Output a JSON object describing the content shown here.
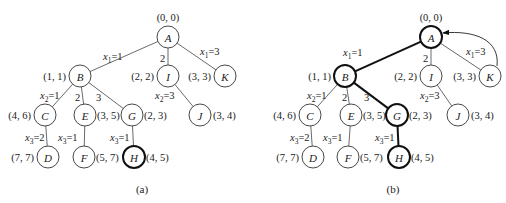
{
  "figures": [
    {
      "caption": "(a)",
      "nodes": [
        {
          "id": "A",
          "label": "A",
          "coord": "(0, 0)",
          "x": 168,
          "y": 37,
          "cx": 168,
          "cy": 17,
          "anchor": "middle",
          "bold": false
        },
        {
          "id": "B",
          "label": "B",
          "coord": "(1, 1)",
          "x": 80,
          "y": 76,
          "cx": 66,
          "cy": 76,
          "anchor": "end",
          "bold": false
        },
        {
          "id": "I",
          "label": "I",
          "coord": "(2, 2)",
          "x": 168,
          "y": 76,
          "cx": 154,
          "cy": 76,
          "anchor": "end",
          "bold": false
        },
        {
          "id": "K",
          "label": "K",
          "coord": "(3, 3)",
          "x": 225,
          "y": 76,
          "cx": 211,
          "cy": 76,
          "anchor": "end",
          "bold": false
        },
        {
          "id": "C",
          "label": "C",
          "coord": "(4, 6)",
          "x": 45,
          "y": 115,
          "cx": 31,
          "cy": 115,
          "anchor": "end",
          "bold": false
        },
        {
          "id": "E",
          "label": "E",
          "coord": "(3, 5)",
          "x": 85,
          "y": 115,
          "cx": 97,
          "cy": 115,
          "anchor": "start",
          "bold": false
        },
        {
          "id": "G",
          "label": "G",
          "coord": "(2, 3)",
          "x": 132,
          "y": 115,
          "cx": 144,
          "cy": 115,
          "anchor": "start",
          "bold": false
        },
        {
          "id": "J",
          "label": "J",
          "coord": "(3, 4)",
          "x": 200,
          "y": 115,
          "cx": 213,
          "cy": 115,
          "anchor": "start",
          "bold": false
        },
        {
          "id": "D",
          "label": "D",
          "coord": "(7, 7)",
          "x": 48,
          "y": 157,
          "cx": 34,
          "cy": 157,
          "anchor": "end",
          "bold": false
        },
        {
          "id": "F",
          "label": "F",
          "coord": "(5, 7)",
          "x": 84,
          "y": 157,
          "cx": 96,
          "cy": 157,
          "anchor": "start",
          "bold": false
        },
        {
          "id": "H",
          "label": "H",
          "coord": "(4, 5)",
          "x": 134,
          "y": 157,
          "cx": 146,
          "cy": 157,
          "anchor": "start",
          "bold": true
        }
      ],
      "edges": [
        {
          "from": "A",
          "to": "B",
          "label_var": "x",
          "label_sub": "1",
          "label_val": "=1",
          "lx": 103,
          "ly": 60,
          "bold": false
        },
        {
          "from": "A",
          "to": "I",
          "label_var": "",
          "label_sub": "",
          "label_val": "2",
          "lx": 160,
          "ly": 62,
          "bold": false
        },
        {
          "from": "A",
          "to": "K",
          "label_var": "x",
          "label_sub": "1",
          "label_val": "=3",
          "lx": 200,
          "ly": 55,
          "bold": false
        },
        {
          "from": "B",
          "to": "C",
          "label_var": "x",
          "label_sub": "2",
          "label_val": "=1",
          "lx": 40,
          "ly": 99,
          "bold": false
        },
        {
          "from": "B",
          "to": "E",
          "label_var": "",
          "label_sub": "",
          "label_val": "2",
          "lx": 75,
          "ly": 101,
          "bold": false
        },
        {
          "from": "B",
          "to": "G",
          "label_var": "",
          "label_sub": "",
          "label_val": "3",
          "lx": 96,
          "ly": 101,
          "bold": false
        },
        {
          "from": "I",
          "to": "J",
          "label_var": "x",
          "label_sub": "2",
          "label_val": "=3",
          "lx": 155,
          "ly": 99,
          "bold": false
        },
        {
          "from": "C",
          "to": "D",
          "label_var": "x",
          "label_sub": "3",
          "label_val": "=2",
          "lx": 25,
          "ly": 141,
          "bold": false
        },
        {
          "from": "E",
          "to": "F",
          "label_var": "x",
          "label_sub": "3",
          "label_val": "=1",
          "lx": 58,
          "ly": 141,
          "bold": false
        },
        {
          "from": "G",
          "to": "H",
          "label_var": "x",
          "label_sub": "3",
          "label_val": "=1",
          "lx": 110,
          "ly": 141,
          "bold": false
        }
      ],
      "back_arrow": null,
      "caption_x": 142,
      "caption_y": 193
    },
    {
      "caption": "(b)",
      "nodes": [
        {
          "id": "A",
          "label": "A",
          "coord": "(0, 0)",
          "x": 431,
          "y": 37,
          "cx": 431,
          "cy": 17,
          "anchor": "middle",
          "bold": true
        },
        {
          "id": "B",
          "label": "B",
          "coord": "(1, 1)",
          "x": 345,
          "y": 76,
          "cx": 331,
          "cy": 76,
          "anchor": "end",
          "bold": true
        },
        {
          "id": "I",
          "label": "I",
          "coord": "(2, 2)",
          "x": 431,
          "y": 76,
          "cx": 417,
          "cy": 76,
          "anchor": "end",
          "bold": false
        },
        {
          "id": "K",
          "label": "K",
          "coord": "(3, 3)",
          "x": 490,
          "y": 76,
          "cx": 476,
          "cy": 76,
          "anchor": "end",
          "bold": false
        },
        {
          "id": "C",
          "label": "C",
          "coord": "(4, 6)",
          "x": 310,
          "y": 115,
          "cx": 296,
          "cy": 115,
          "anchor": "end",
          "bold": false
        },
        {
          "id": "E",
          "label": "E",
          "coord": "(3, 5)",
          "x": 351,
          "y": 115,
          "cx": 363,
          "cy": 115,
          "anchor": "start",
          "bold": false
        },
        {
          "id": "G",
          "label": "G",
          "coord": "(2, 3)",
          "x": 397,
          "y": 115,
          "cx": 409,
          "cy": 115,
          "anchor": "start",
          "bold": true
        },
        {
          "id": "J",
          "label": "J",
          "coord": "(3, 4)",
          "x": 458,
          "y": 115,
          "cx": 471,
          "cy": 115,
          "anchor": "start",
          "bold": false
        },
        {
          "id": "D",
          "label": "D",
          "coord": "(7, 7)",
          "x": 313,
          "y": 157,
          "cx": 299,
          "cy": 157,
          "anchor": "end",
          "bold": false
        },
        {
          "id": "F",
          "label": "F",
          "coord": "(5, 7)",
          "x": 348,
          "y": 157,
          "cx": 360,
          "cy": 157,
          "anchor": "start",
          "bold": false
        },
        {
          "id": "H",
          "label": "H",
          "coord": "(4, 5)",
          "x": 399,
          "y": 157,
          "cx": 411,
          "cy": 157,
          "anchor": "start",
          "bold": true
        }
      ],
      "edges": [
        {
          "from": "A",
          "to": "B",
          "label_var": "x",
          "label_sub": "1",
          "label_val": "=1",
          "lx": 343,
          "ly": 56,
          "bold": true
        },
        {
          "from": "A",
          "to": "I",
          "label_var": "",
          "label_sub": "",
          "label_val": "2",
          "lx": 423,
          "ly": 62,
          "bold": false
        },
        {
          "from": "A",
          "to": "K",
          "label_var": "x",
          "label_sub": "1",
          "label_val": "=3",
          "lx": 466,
          "ly": 55,
          "bold": false
        },
        {
          "from": "B",
          "to": "C",
          "label_var": "x",
          "label_sub": "2",
          "label_val": "=1",
          "lx": 307,
          "ly": 99,
          "bold": false
        },
        {
          "from": "B",
          "to": "E",
          "label_var": "",
          "label_sub": "",
          "label_val": "2",
          "lx": 342,
          "ly": 101,
          "bold": false
        },
        {
          "from": "B",
          "to": "G",
          "label_var": "",
          "label_sub": "",
          "label_val": "3",
          "lx": 364,
          "ly": 101,
          "bold": true
        },
        {
          "from": "I",
          "to": "J",
          "label_var": "x",
          "label_sub": "2",
          "label_val": "=3",
          "lx": 420,
          "ly": 99,
          "bold": false
        },
        {
          "from": "C",
          "to": "D",
          "label_var": "x",
          "label_sub": "3",
          "label_val": "=2",
          "lx": 290,
          "ly": 141,
          "bold": false
        },
        {
          "from": "E",
          "to": "F",
          "label_var": "x",
          "label_sub": "3",
          "label_val": "=1",
          "lx": 323,
          "ly": 141,
          "bold": false
        },
        {
          "from": "G",
          "to": "H",
          "label_var": "x",
          "label_sub": "3",
          "label_val": "=1",
          "lx": 375,
          "ly": 141,
          "bold": true
        }
      ],
      "back_arrow": {
        "from": "K",
        "to": "A",
        "path": "M 497 66 C 500 40, 475 30, 443 33"
      },
      "caption_x": 393,
      "caption_y": 193
    }
  ]
}
